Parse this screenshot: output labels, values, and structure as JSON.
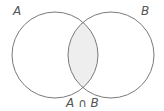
{
  "diagram": {
    "type": "venn",
    "sets": [
      {
        "label": "A",
        "cx": 55,
        "cy": 55,
        "r": 43
      },
      {
        "label": "B",
        "cx": 111,
        "cy": 55,
        "r": 43
      }
    ],
    "intersection": {
      "label": "A ∩ B",
      "shaded": true
    },
    "colors": {
      "stroke": "#7a7a7a",
      "intersection_fill": "#eeeeee",
      "background": "#ffffff",
      "label": "#555555"
    }
  }
}
